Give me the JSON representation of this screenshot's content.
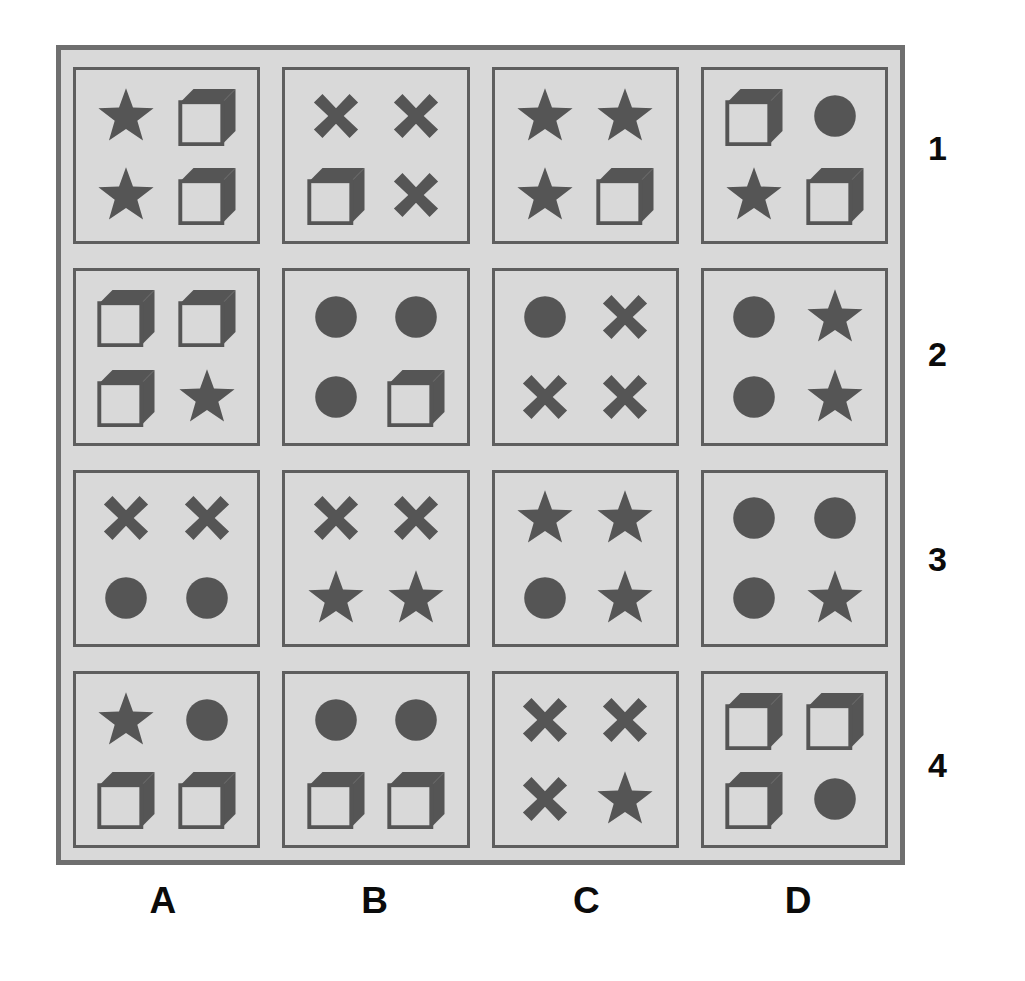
{
  "figure": {
    "colors": {
      "page_background": "#ffffff",
      "panel_background": "#d9d9d9",
      "panel_border": "#6f6f6f",
      "cell_border": "#5e5e5e",
      "shape_fill": "#555555",
      "label_text": "#0b0b0b"
    }
  },
  "column_labels": [
    "A",
    "B",
    "C",
    "D"
  ],
  "row_labels": [
    "1",
    "2",
    "3",
    "4"
  ],
  "shape_names": {
    "star": "star-icon",
    "square": "cube-square-icon",
    "circle": "filled-circle-icon",
    "cross": "x-cross-icon"
  },
  "chart_data": {
    "type": "table",
    "categories": [
      "A",
      "B",
      "C",
      "D"
    ],
    "rows": [
      "1",
      "2",
      "3",
      "4"
    ],
    "cells": [
      {
        "row": "1",
        "col": "A",
        "shapes": [
          "star",
          "square",
          "star",
          "square"
        ]
      },
      {
        "row": "1",
        "col": "B",
        "shapes": [
          "cross",
          "cross",
          "square",
          "cross"
        ]
      },
      {
        "row": "1",
        "col": "C",
        "shapes": [
          "star",
          "star",
          "star",
          "square"
        ]
      },
      {
        "row": "1",
        "col": "D",
        "shapes": [
          "square",
          "circle",
          "star",
          "square"
        ]
      },
      {
        "row": "2",
        "col": "A",
        "shapes": [
          "square",
          "square",
          "square",
          "star"
        ]
      },
      {
        "row": "2",
        "col": "B",
        "shapes": [
          "circle",
          "circle",
          "circle",
          "square"
        ]
      },
      {
        "row": "2",
        "col": "C",
        "shapes": [
          "circle",
          "cross",
          "cross",
          "cross"
        ]
      },
      {
        "row": "2",
        "col": "D",
        "shapes": [
          "circle",
          "star",
          "circle",
          "star"
        ]
      },
      {
        "row": "3",
        "col": "A",
        "shapes": [
          "cross",
          "cross",
          "circle",
          "circle"
        ]
      },
      {
        "row": "3",
        "col": "B",
        "shapes": [
          "cross",
          "cross",
          "star",
          "star"
        ]
      },
      {
        "row": "3",
        "col": "C",
        "shapes": [
          "star",
          "star",
          "circle",
          "star"
        ]
      },
      {
        "row": "3",
        "col": "D",
        "shapes": [
          "circle",
          "circle",
          "circle",
          "star"
        ]
      },
      {
        "row": "4",
        "col": "A",
        "shapes": [
          "star",
          "circle",
          "square",
          "square"
        ]
      },
      {
        "row": "4",
        "col": "B",
        "shapes": [
          "circle",
          "circle",
          "square",
          "square"
        ]
      },
      {
        "row": "4",
        "col": "C",
        "shapes": [
          "cross",
          "cross",
          "cross",
          "star"
        ]
      },
      {
        "row": "4",
        "col": "D",
        "shapes": [
          "square",
          "square",
          "square",
          "circle"
        ]
      }
    ]
  }
}
